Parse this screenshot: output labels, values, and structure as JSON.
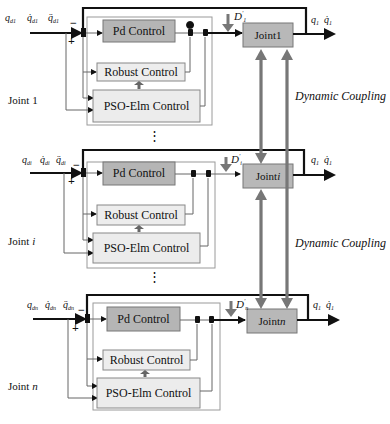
{
  "colors": {
    "pd_fill": "#b5b5b5",
    "robust_fill": "#ededed",
    "pso_fill": "#ececec",
    "joint_fill": "#b8b8b8",
    "coupling_arrow": "#777777",
    "outer_box": "#9a9a9a",
    "signal_line": "#111111"
  },
  "blocks": [
    {
      "label": "Joint 1",
      "label_base": "Joint ",
      "label_idx": "1",
      "inputs": {
        "q": "q",
        "qd": "q̇",
        "qdd": "q̈",
        "sub": "d1"
      },
      "minus": "−",
      "plus": "+",
      "pd": "Pd Control",
      "robust": "Robust Control",
      "pso": "PSO-Elm Control",
      "disturbance": "D",
      "disturbance_sub": "1",
      "joint_box_base": "Joint ",
      "joint_box_idx": "1",
      "outputs": {
        "q": "q",
        "qd": "q̇",
        "sub": "1"
      }
    },
    {
      "label": "Joint i",
      "label_base": "Joint ",
      "label_idx": "i",
      "inputs": {
        "q": "q",
        "qd": "q̇",
        "qdd": "q̈",
        "sub": "di"
      },
      "minus": "−",
      "plus": "+",
      "pd": "Pd Control",
      "robust": "Robust Control",
      "pso": "PSO-Elm Control",
      "disturbance": "D",
      "disturbance_sub": "i",
      "joint_box_base": "Joint ",
      "joint_box_idx": "i",
      "outputs": {
        "q": "q",
        "qd": "q̇",
        "sub": "1"
      }
    },
    {
      "label": "Joint n",
      "label_base": "Joint ",
      "label_idx": "n",
      "inputs": {
        "q": "q",
        "qd": "q̇",
        "qdd": "q̈",
        "sub": "dn"
      },
      "minus": "−",
      "plus": "+",
      "pd": "Pd Control",
      "robust": "Robust Control",
      "pso": "PSO-Elm Control",
      "disturbance": "D",
      "disturbance_sub": "n",
      "joint_box_base": "Joint ",
      "joint_box_idx": "n",
      "outputs": {
        "q": "q",
        "qd": "q̇",
        "sub": "1"
      }
    }
  ],
  "coupling_labels": [
    "Dynamic Coupling",
    "Dynamic Coupling"
  ],
  "ellipsis": "⋮"
}
